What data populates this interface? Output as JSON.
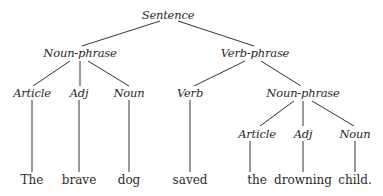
{
  "diagram": {
    "type": "parse-tree",
    "nodes": {
      "s": {
        "label": "Sentence",
        "kind": "category",
        "x": 168,
        "y": 15
      },
      "np1": {
        "label": "Noun-phrase",
        "kind": "category",
        "x": 80,
        "y": 53
      },
      "vp": {
        "label": "Verb-phrase",
        "kind": "category",
        "x": 255,
        "y": 53
      },
      "art1": {
        "label": "Article",
        "kind": "category",
        "x": 32,
        "y": 93
      },
      "adj1": {
        "label": "Adj",
        "kind": "category",
        "x": 79,
        "y": 93
      },
      "n1": {
        "label": "Noun",
        "kind": "category",
        "x": 129,
        "y": 93
      },
      "v": {
        "label": "Verb",
        "kind": "category",
        "x": 190,
        "y": 93
      },
      "np2": {
        "label": "Noun-phrase",
        "kind": "category",
        "x": 303,
        "y": 93
      },
      "art2": {
        "label": "Article",
        "kind": "category",
        "x": 257,
        "y": 134
      },
      "adj2": {
        "label": "Adj",
        "kind": "category",
        "x": 303,
        "y": 134
      },
      "n2": {
        "label": "Noun",
        "kind": "category",
        "x": 355,
        "y": 134
      },
      "w1": {
        "label": "The",
        "kind": "word",
        "x": 32,
        "y": 180
      },
      "w2": {
        "label": "brave",
        "kind": "word",
        "x": 79,
        "y": 180
      },
      "w3": {
        "label": "dog",
        "kind": "word",
        "x": 129,
        "y": 180
      },
      "w4": {
        "label": "saved",
        "kind": "word",
        "x": 190,
        "y": 180
      },
      "w5": {
        "label": "the",
        "kind": "word",
        "x": 257,
        "y": 180
      },
      "w6": {
        "label": "drowning",
        "kind": "word",
        "x": 303,
        "y": 180
      },
      "w7": {
        "label": "child.",
        "kind": "word",
        "x": 355,
        "y": 180
      }
    },
    "edges": [
      {
        "from": "s",
        "to": "np1",
        "x1": 160,
        "y1": 21,
        "x2": 82,
        "y2": 46
      },
      {
        "from": "s",
        "to": "vp",
        "x1": 178,
        "y1": 21,
        "x2": 254,
        "y2": 46
      },
      {
        "from": "np1",
        "to": "art1",
        "x1": 70,
        "y1": 61,
        "x2": 33,
        "y2": 86
      },
      {
        "from": "np1",
        "to": "adj1",
        "x1": 80,
        "y1": 61,
        "x2": 80,
        "y2": 86
      },
      {
        "from": "np1",
        "to": "n1",
        "x1": 88,
        "y1": 61,
        "x2": 129,
        "y2": 86
      },
      {
        "from": "vp",
        "to": "v",
        "x1": 245,
        "y1": 61,
        "x2": 194,
        "y2": 86
      },
      {
        "from": "vp",
        "to": "np2",
        "x1": 261,
        "y1": 61,
        "x2": 301,
        "y2": 86
      },
      {
        "from": "np2",
        "to": "art2",
        "x1": 294,
        "y1": 101,
        "x2": 260,
        "y2": 126
      },
      {
        "from": "np2",
        "to": "adj2",
        "x1": 303,
        "y1": 101,
        "x2": 303,
        "y2": 126
      },
      {
        "from": "np2",
        "to": "n2",
        "x1": 312,
        "y1": 101,
        "x2": 354,
        "y2": 126
      },
      {
        "from": "art1",
        "to": "w1",
        "x1": 32,
        "y1": 100,
        "x2": 32,
        "y2": 172
      },
      {
        "from": "adj1",
        "to": "w2",
        "x1": 79,
        "y1": 100,
        "x2": 79,
        "y2": 172
      },
      {
        "from": "n1",
        "to": "w3",
        "x1": 129,
        "y1": 100,
        "x2": 129,
        "y2": 172
      },
      {
        "from": "v",
        "to": "w4",
        "x1": 190,
        "y1": 100,
        "x2": 190,
        "y2": 172
      },
      {
        "from": "art2",
        "to": "w5",
        "x1": 250,
        "y1": 141,
        "x2": 250,
        "y2": 172
      },
      {
        "from": "adj2",
        "to": "w6",
        "x1": 303,
        "y1": 141,
        "x2": 303,
        "y2": 172
      },
      {
        "from": "n2",
        "to": "w7",
        "x1": 355,
        "y1": 141,
        "x2": 355,
        "y2": 172
      }
    ],
    "colors": {
      "line": "#333333",
      "text": "#2a2a2a",
      "background": "#ffffff"
    }
  }
}
